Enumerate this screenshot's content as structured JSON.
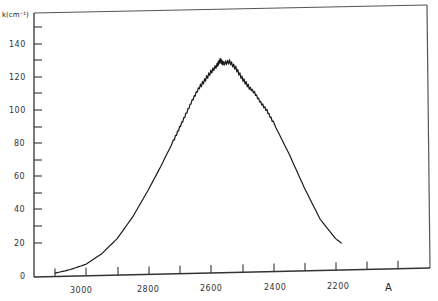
{
  "chart_data": {
    "type": "line",
    "title": "",
    "xlabel": "A",
    "ylabel": "k(cm⁻¹)",
    "x_direction": "decreasing",
    "xlim": [
      3200,
      1900
    ],
    "ylim": [
      0,
      150
    ],
    "x_ticks": [
      3100,
      3000,
      2900,
      2800,
      2700,
      2600,
      2500,
      2400,
      2300,
      2200,
      2100,
      2000
    ],
    "x_tick_labels": [
      "3000",
      "2800",
      "2600",
      "2400",
      "2200"
    ],
    "y_ticks": [
      0,
      10,
      20,
      30,
      40,
      50,
      60,
      70,
      80,
      90,
      100,
      110,
      120,
      130,
      140,
      150
    ],
    "y_tick_labels": [
      "0",
      "20",
      "40",
      "60",
      "80",
      "100",
      "120",
      "140"
    ],
    "grid": false,
    "legend": null,
    "series": [
      {
        "name": "k",
        "x": [
          3100,
          3050,
          3000,
          2950,
          2900,
          2850,
          2800,
          2760,
          2720,
          2700,
          2680,
          2660,
          2640,
          2620,
          2600,
          2580,
          2570,
          2560,
          2540,
          2520,
          2500,
          2480,
          2460,
          2440,
          2420,
          2400,
          2350,
          2300,
          2250,
          2200,
          2180
        ],
        "y": [
          2,
          4,
          7,
          13,
          22,
          35,
          51,
          65,
          80,
          88,
          96,
          104,
          111,
          116,
          121,
          125,
          128,
          126,
          127,
          123,
          117,
          112,
          108,
          102,
          97,
          90,
          71,
          50,
          31,
          19,
          16
        ]
      }
    ]
  },
  "labels": {
    "y_axis_title": "k(cm⁻¹)",
    "x_axis_unit": "A",
    "y_ticks": [
      "140",
      "120",
      "100",
      "80",
      "60",
      "40",
      "20",
      "0"
    ],
    "x_ticks": [
      "3000",
      "2800",
      "2600",
      "2400",
      "2200"
    ]
  }
}
